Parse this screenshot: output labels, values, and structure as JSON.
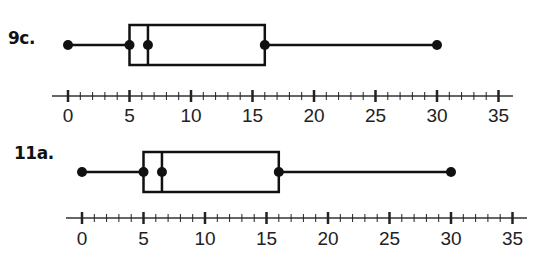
{
  "chart_data": [
    {
      "type": "boxplot",
      "title": "9c.",
      "min": 0,
      "q1": 5,
      "median": 6.5,
      "q3": 16,
      "max": 30,
      "xlim": [
        0,
        35
      ],
      "xticks_major": [
        0,
        5,
        10,
        15,
        20,
        25,
        30,
        35
      ],
      "minor_tick_step": 1,
      "xlabel": "",
      "ylabel": "",
      "grid": false
    },
    {
      "type": "boxplot",
      "title": "11a.",
      "min": 0,
      "q1": 5,
      "median": 6.5,
      "q3": 16,
      "max": 30,
      "xlim": [
        0,
        35
      ],
      "xticks_major": [
        0,
        5,
        10,
        15,
        20,
        25,
        30,
        35
      ],
      "minor_tick_step": 1,
      "xlabel": "",
      "ylabel": "",
      "grid": false
    }
  ],
  "labels": {
    "plot1": "9c.",
    "plot2": "11a."
  },
  "colors": {
    "ink": "#111111",
    "background": "#ffffff"
  }
}
